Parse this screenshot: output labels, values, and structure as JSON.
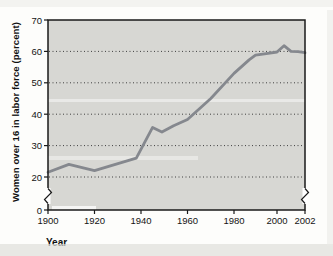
{
  "chart_data": {
    "type": "line",
    "title": "",
    "xlabel": "Year",
    "ylabel": "Women over 16 in labor force (percent)",
    "x": [
      1900,
      1909,
      1920,
      1938,
      1945,
      1949,
      1954,
      1960,
      1970,
      1980,
      1987,
      1990,
      1995,
      2000,
      2000.5,
      2001,
      2001.5,
      2002
    ],
    "values": [
      21.5,
      24,
      22,
      26,
      35.8,
      34.3,
      36.3,
      38.3,
      45,
      53,
      57.3,
      58.8,
      59.3,
      59.8,
      61.8,
      60,
      59.9,
      59.6
    ],
    "series_name": "Women over 16 in labor force (percent)",
    "xticks": [
      1900,
      1920,
      1940,
      1960,
      1980,
      2000,
      2002
    ],
    "yticks": [
      0,
      20,
      30,
      40,
      50,
      60,
      70
    ],
    "grid_values": [
      20,
      30,
      40,
      50,
      60
    ],
    "ylim": [
      0,
      70
    ],
    "xlim": [
      1900,
      2002
    ],
    "grid": "dotted horizontal lines",
    "legend": "none",
    "axis_break": "y-axis broken between 0 and 20 (zigzag marks on left axis and right border); x-axis segment 2000-2002 expanded",
    "colors": {
      "line": "#85888e",
      "plot_background": "#d7d7d3",
      "axis": "#1a1a1a",
      "gridline": "#3f3f3f",
      "text": "#141414"
    }
  }
}
